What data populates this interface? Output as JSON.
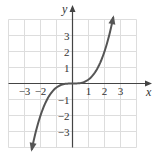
{
  "chart_data": {
    "type": "line",
    "title": "",
    "xlabel": "x",
    "ylabel": "y",
    "xlim": [
      -4,
      4
    ],
    "ylim": [
      -4,
      4
    ],
    "grid": true,
    "x_ticks": [
      -3,
      -2,
      1,
      2,
      3
    ],
    "x_tick_labels": [
      "−3",
      "−2",
      "1",
      "2",
      "3"
    ],
    "y_ticks": [
      3,
      2,
      1,
      -1,
      -2,
      -3
    ],
    "y_tick_labels": [
      "3",
      "2",
      "1",
      "−1",
      "−2",
      "−3"
    ],
    "series": [
      {
        "name": "y = x^3/4",
        "function": "x^3/4",
        "x_range": [
          -2.55,
          2.55
        ],
        "arrows": "both-ends",
        "color": "#555555",
        "points": [
          {
            "x": -2.55,
            "y": -4.15
          },
          {
            "x": -2,
            "y": -2
          },
          {
            "x": -1,
            "y": -0.25
          },
          {
            "x": 0,
            "y": 0
          },
          {
            "x": 1,
            "y": 0.25
          },
          {
            "x": 2,
            "y": 2
          },
          {
            "x": 2.55,
            "y": 4.15
          }
        ]
      }
    ]
  },
  "colors": {
    "grid": "#dddddd",
    "axis": "#444444",
    "curve": "#555555"
  }
}
